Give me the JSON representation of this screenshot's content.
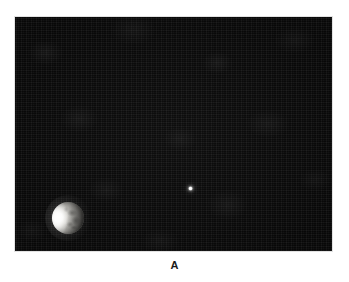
{
  "page": {
    "background_color": "#ffffff",
    "width": 349,
    "height": 282
  },
  "clipped_header": {
    "text": ""
  },
  "figure": {
    "caption": "A",
    "frame": {
      "border_color": "#e2e2e2",
      "background_color": "#0a0a0a"
    },
    "objects": [
      {
        "name": "crescent-body",
        "label": "",
        "kind": "crescent-lit-disk",
        "x": 52,
        "y": 202,
        "diameter": 32,
        "lit_limb": "left",
        "highlight_color": "#ffffff",
        "disk_color": "#8e8d89",
        "shadow_color": "#5c5b58"
      },
      {
        "name": "point-object",
        "label": "",
        "kind": "point-source",
        "x": 189,
        "y": 187,
        "diameter": 3,
        "color": "#ffffff"
      }
    ]
  }
}
